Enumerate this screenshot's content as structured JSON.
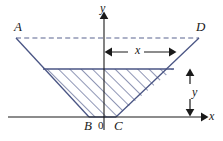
{
  "figure": {
    "colors": {
      "shape_stroke": "#4a5584",
      "hatch": "#515d8c",
      "axis": "#1a1a1a",
      "dimension": "#1a1a1a",
      "dashed": "#5a6490",
      "background": "#ffffff"
    },
    "vertex_labels": [
      {
        "name": "A",
        "text": "A",
        "x": 14,
        "y": 20
      },
      {
        "name": "D",
        "text": "D",
        "x": 196,
        "y": 20
      },
      {
        "name": "B",
        "text": "B",
        "x": 84,
        "y": 119
      },
      {
        "name": "C",
        "text": "C",
        "x": 114,
        "y": 119
      }
    ],
    "origin_label": {
      "text": "0",
      "x": 98,
      "y": 120
    },
    "axis_labels": [
      {
        "name": "y-axis-label",
        "text": "y",
        "x": 100,
        "y": 2
      },
      {
        "name": "x-axis-label",
        "text": "x",
        "x": 209,
        "y": 110
      }
    ],
    "dimension_labels": [
      {
        "name": "x-dimension-label",
        "text": "x",
        "x": 135,
        "y": 44
      },
      {
        "name": "y-dimension-label",
        "text": "y",
        "x": 192,
        "y": 86
      }
    ],
    "geometry": {
      "y_axis_x": 104,
      "x_axis_y": 117,
      "A": [
        16,
        38
      ],
      "D": [
        199,
        38
      ],
      "B": [
        89,
        117
      ],
      "C": [
        116,
        117
      ],
      "hatch_top_y": 69,
      "hatch_left_x": 43,
      "hatch_right_x": 174,
      "x_dim_y": 52,
      "x_dim_from": 104,
      "x_dim_to": 176,
      "y_dim_x": 190,
      "y_dim_from": 70,
      "y_dim_to": 115
    }
  }
}
